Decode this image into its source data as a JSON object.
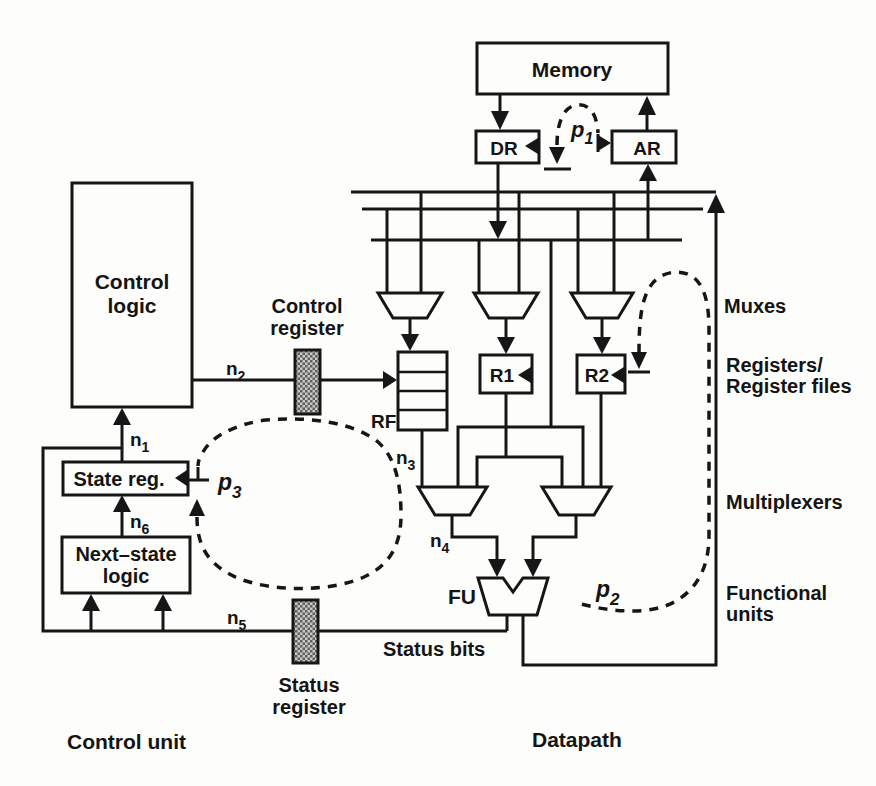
{
  "diagram": {
    "boxes": {
      "memory": "Memory",
      "dr": "DR",
      "ar": "AR",
      "rf": "RF",
      "r1": "R1",
      "r2": "R2",
      "fu": "FU",
      "control_logic": {
        "line1": "Control",
        "line2": "logic"
      },
      "state_reg": "State reg.",
      "next_state": {
        "line1": "Next–state",
        "line2": "logic"
      }
    },
    "registers": {
      "control_register": {
        "line1": "Control",
        "line2": "register"
      },
      "status_register": {
        "line1": "Status",
        "line2": "register"
      }
    },
    "signals": {
      "n1": {
        "base": "n",
        "sub": "1"
      },
      "n2": {
        "base": "n",
        "sub": "2"
      },
      "n3": {
        "base": "n",
        "sub": "3"
      },
      "n4": {
        "base": "n",
        "sub": "4"
      },
      "n5": {
        "base": "n",
        "sub": "5"
      },
      "n6": {
        "base": "n",
        "sub": "6"
      },
      "p1": {
        "base": "p",
        "sub": "1"
      },
      "p2": {
        "base": "p",
        "sub": "2"
      },
      "p3": {
        "base": "p",
        "sub": "3"
      }
    },
    "annotations": {
      "status_bits": "Status bits",
      "muxes": "Muxes",
      "registers_line1": "Registers/",
      "registers_line2": "Register files",
      "multiplexers": "Multiplexers",
      "functional_line1": "Functional",
      "functional_line2": "units"
    },
    "sections": {
      "control_unit": "Control unit",
      "datapath": "Datapath"
    },
    "colors": {
      "ink": "#161616",
      "paper": "#fdfdfb",
      "hatch_light": "#c9c9c5",
      "hatch_dark": "#5f5f5f"
    }
  }
}
